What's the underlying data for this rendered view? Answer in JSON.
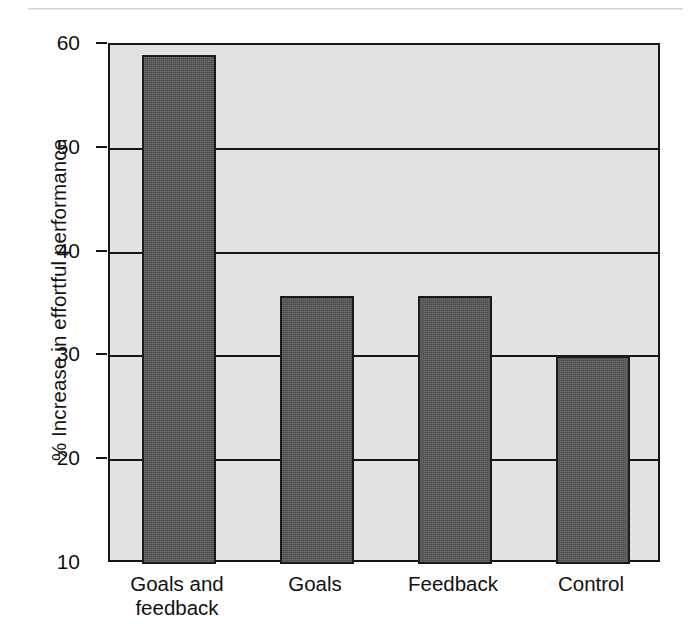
{
  "chart_data": {
    "type": "bar",
    "title": "",
    "subtitle": "",
    "xlabel": "",
    "ylabel": "% Increase in effortful performance",
    "categories": [
      "Goals and\nfeedback",
      "Goals",
      "Feedback",
      "Control"
    ],
    "category_labels_flat": [
      "Goals and feedback",
      "Goals",
      "Feedback",
      "Control"
    ],
    "values": [
      59,
      35.8,
      35.8,
      30
    ],
    "ylim": [
      10,
      60
    ],
    "yticks": [
      60,
      50,
      40,
      30,
      20,
      10
    ],
    "ytick_labels": [
      "60",
      "50",
      "40",
      "30",
      "20",
      "10"
    ],
    "grid": true,
    "grid_axis": "y",
    "legend": false,
    "legend_position": "none",
    "bar_color": "#575757",
    "bar_edge_color": "#1b1b1b",
    "plot_background": "#e7e7e7",
    "axis_color": "#161616"
  },
  "axis": {
    "y_title": "% Increase in effortful performance"
  }
}
